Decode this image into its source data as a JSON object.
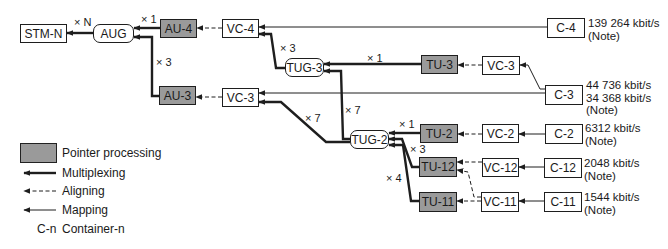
{
  "nodes": {
    "stm_n": "STM-N",
    "aug": "AUG",
    "au4": "AU-4",
    "vc4": "VC-4",
    "c4": "C-4",
    "tug3": "TUG-3",
    "tu3": "TU-3",
    "vc3_upper": "VC-3",
    "c3": "C-3",
    "au3": "AU-3",
    "vc3_lower": "VC-3",
    "tug2": "TUG-2",
    "tu2": "TU-2",
    "vc2": "VC-2",
    "c2": "C-2",
    "tu12": "TU-12",
    "vc12": "VC-12",
    "c12": "C-12",
    "tu11": "TU-11",
    "vc11": "VC-11",
    "c11": "C-11"
  },
  "multipliers": {
    "aug_to_stm": "× N",
    "au4_to_aug": "× 1",
    "au3_to_aug": "× 3",
    "tug3_to_vc4": "× 3",
    "tu3_to_tug3": "× 1",
    "tug2_to_tug3": "× 7",
    "tug2_to_vc3": "× 7",
    "tu2_to_tug2": "× 1",
    "tu12_to_tug2": "× 3",
    "tu11_to_tug2": "× 4"
  },
  "rates": {
    "c4": "139 264 kbit/s\n(Note)",
    "c3": "44 736 kbit/s\n34 368 kbit/s\n(Note)",
    "c2": "6312 kbit/s\n(Note)",
    "c12": "2048 kbit/s\n(Note)",
    "c11": "1544 kbit/s\n(Note)"
  },
  "legend": {
    "pointer": "Pointer processing",
    "multiplexing": "Multiplexing",
    "aligning": "Aligning",
    "mapping": "Mapping",
    "container_key": "C-n",
    "container_label": "Container-n"
  },
  "colors": {
    "pointer_fill": "#9a9a9a",
    "line": "#1e1e1e"
  }
}
